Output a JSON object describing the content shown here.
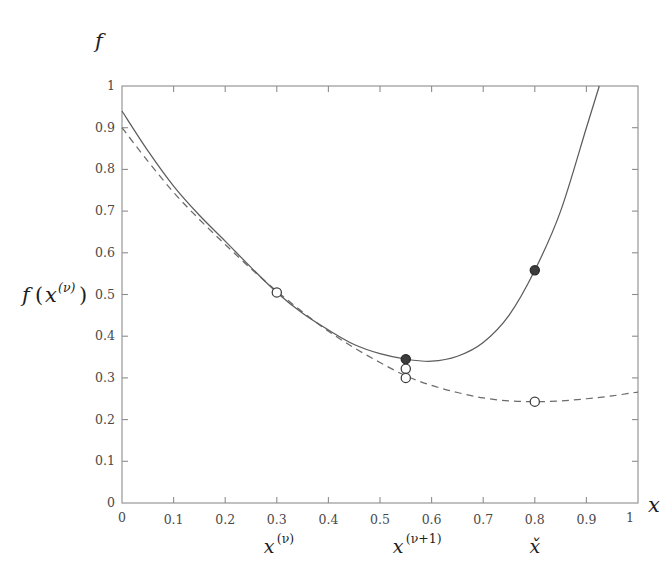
{
  "figure": {
    "top_label": "f",
    "y_axis_label": {
      "base": "f",
      "open_paren": "(",
      "var": "x",
      "sup": "(ν)",
      "close_paren": ")"
    },
    "x_axis_label": "x"
  },
  "chart_data": {
    "type": "line",
    "title": "",
    "xlabel": "x",
    "ylabel": "f(x^(ν))",
    "xlim": [
      0,
      1
    ],
    "ylim": [
      0,
      1
    ],
    "grid": false,
    "legend": "none",
    "x_ticks": [
      "0",
      "0.1",
      "0.2",
      "0.3",
      "0.4",
      "0.5",
      "0.6",
      "0.7",
      "0.8",
      "0.9",
      "1"
    ],
    "x_tick_values": [
      0,
      0.1,
      0.2,
      0.3,
      0.4,
      0.5,
      0.6,
      0.7,
      0.8,
      0.9,
      1
    ],
    "y_ticks": [
      "0",
      "0.1",
      "0.2",
      "0.3",
      "0.4",
      "0.5",
      "0.6",
      "0.7",
      "0.8",
      "0.9",
      "1"
    ],
    "y_tick_values": [
      0,
      0.1,
      0.2,
      0.3,
      0.4,
      0.5,
      0.6,
      0.7,
      0.8,
      0.9,
      1
    ],
    "series": [
      {
        "name": "objective function f",
        "style": "solid",
        "color": "#5c5c5c",
        "x": [
          0.0,
          0.05,
          0.1,
          0.15,
          0.2,
          0.25,
          0.3,
          0.35,
          0.4,
          0.45,
          0.5,
          0.55,
          0.6,
          0.65,
          0.7,
          0.75,
          0.8,
          0.85,
          0.9,
          0.925
        ],
        "values": [
          0.94,
          0.845,
          0.76,
          0.69,
          0.628,
          0.565,
          0.505,
          0.455,
          0.415,
          0.38,
          0.358,
          0.345,
          0.34,
          0.352,
          0.385,
          0.45,
          0.558,
          0.7,
          0.9,
          1.0
        ]
      },
      {
        "name": "quadratic model approximation",
        "style": "dashed",
        "color": "#6b6b6b",
        "x": [
          0.0,
          0.05,
          0.1,
          0.15,
          0.2,
          0.25,
          0.3,
          0.35,
          0.4,
          0.45,
          0.5,
          0.55,
          0.6,
          0.65,
          0.7,
          0.75,
          0.8,
          0.85,
          0.9,
          0.95,
          1.0
        ],
        "values": [
          0.9,
          0.82,
          0.745,
          0.68,
          0.62,
          0.562,
          0.508,
          0.458,
          0.412,
          0.372,
          0.337,
          0.305,
          0.282,
          0.265,
          0.252,
          0.245,
          0.243,
          0.245,
          0.25,
          0.257,
          0.266
        ]
      }
    ],
    "markers": [
      {
        "name": "iterate-current-on-f",
        "x": 0.3,
        "y": 0.505,
        "style": "open"
      },
      {
        "name": "iterate-next-on-f",
        "x": 0.55,
        "y": 0.345,
        "style": "filled"
      },
      {
        "name": "iterate-next-on-model-upper",
        "x": 0.55,
        "y": 0.322,
        "style": "open"
      },
      {
        "name": "iterate-next-on-model-lower",
        "x": 0.55,
        "y": 0.3,
        "style": "open"
      },
      {
        "name": "trial-point-on-f",
        "x": 0.8,
        "y": 0.558,
        "style": "filled"
      },
      {
        "name": "model-minimizer",
        "x": 0.8,
        "y": 0.243,
        "style": "open"
      }
    ],
    "annotations": [
      {
        "name": "x-iterate-nu",
        "x": 0.3,
        "text": {
          "var": "x",
          "sup": "(ν)"
        }
      },
      {
        "name": "x-iterate-nu-plus-1",
        "x": 0.55,
        "text": {
          "var": "x",
          "sup": "(ν+1)"
        }
      },
      {
        "name": "x-model-minimizer",
        "x": 0.8,
        "text": {
          "var": "x̌",
          "sup": ""
        }
      }
    ]
  }
}
